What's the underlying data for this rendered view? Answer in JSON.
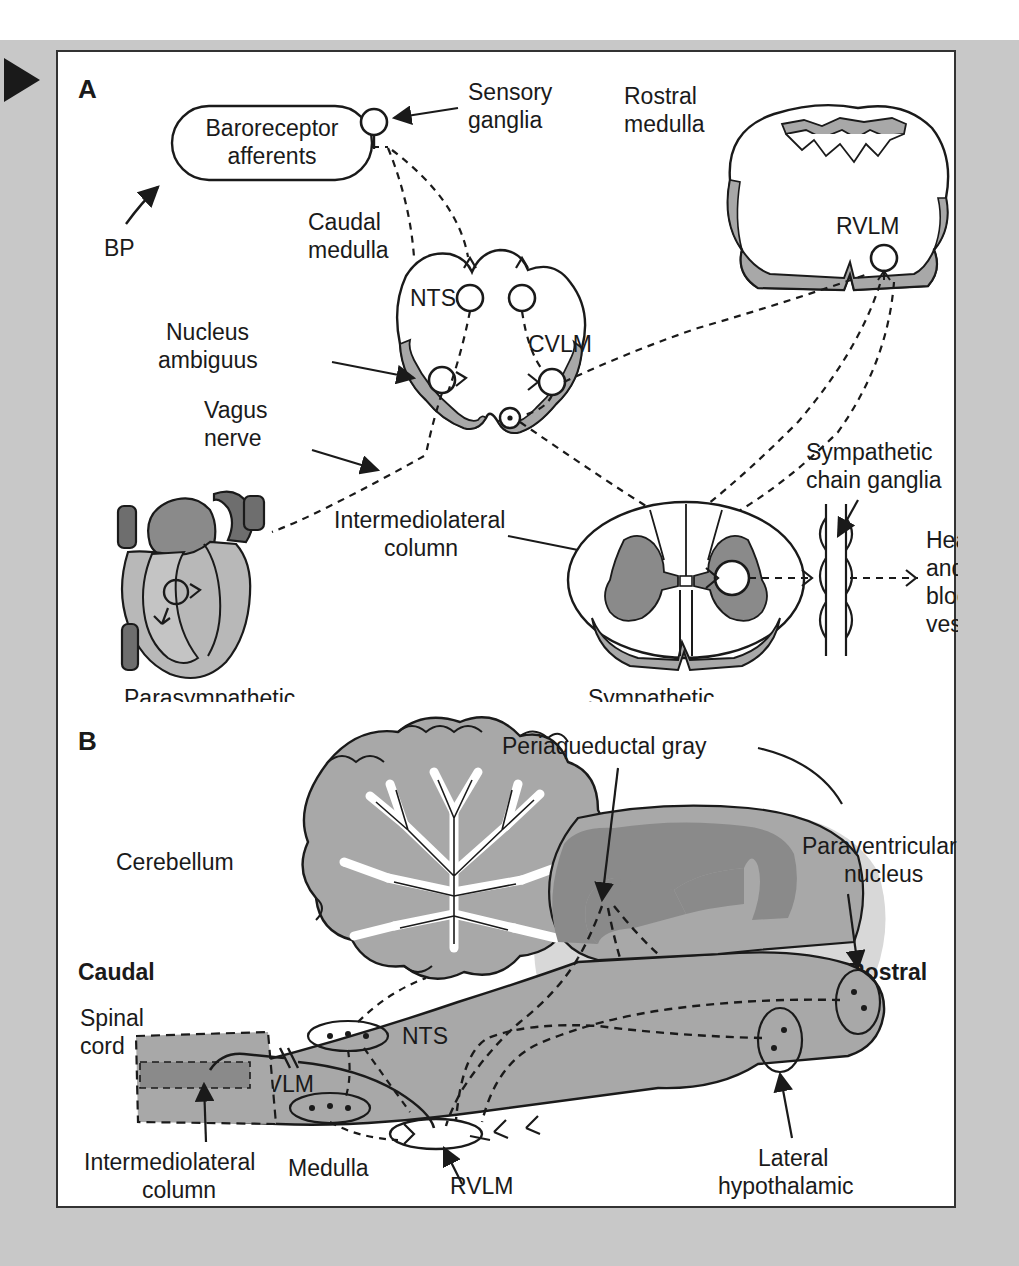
{
  "figure": {
    "type": "anatomical-diagram",
    "marker": "triangle-pointer"
  },
  "panel_a": {
    "letter": "A",
    "labels": {
      "baroreceptor_afferents": "Baroreceptor\nafferents",
      "baroreceptor_line1": "Baroreceptor",
      "baroreceptor_line2": "afferents",
      "bp": "BP",
      "sensory_ganglia_line1": "Sensory",
      "sensory_ganglia_line2": "ganglia",
      "rostral_medulla_line1": "Rostral",
      "rostral_medulla_line2": "medulla",
      "caudal_medulla_line1": "Caudal",
      "caudal_medulla_line2": "medulla",
      "nts": "NTS",
      "cvlm": "CVLM",
      "rvlm": "RVLM",
      "nucleus_ambiguus_line1": "Nucleus",
      "nucleus_ambiguus_line2": "ambiguus",
      "vagus_nerve_line1": "Vagus",
      "vagus_nerve_line2": "nerve",
      "intermediolateral_line1": "Intermediolateral",
      "intermediolateral_line2": "column",
      "sympathetic_chain_line1": "Sympathetic",
      "sympathetic_chain_line2": "chain ganglia",
      "heart_blood_line1": "Heart",
      "heart_blood_line2": "and",
      "heart_blood_line3": "blood",
      "heart_blood_line4": "vessels",
      "parasympathetic": "Parasympathetic",
      "sympathetic": "Sympathetic"
    }
  },
  "panel_b": {
    "letter": "B",
    "labels": {
      "cerebellum": "Cerebellum",
      "caudal": "Caudal",
      "rostral": "Rostral",
      "spinal_cord_line1": "Spinal",
      "spinal_cord_line2": "cord",
      "periaqueductal_gray": "Periaqueductal gray",
      "paraventricular_line1": "Paraventricular",
      "paraventricular_line2": "nucleus",
      "lateral_hypothalamic_line1": "Lateral",
      "lateral_hypothalamic_line2": "hypothalamic",
      "lateral_hypothalamic_line3": "area",
      "nts": "NTS",
      "cvlm": "CVLM",
      "rvlm": "RVLM",
      "medulla": "Medulla",
      "intermediolateral_line1": "Intermediolateral",
      "intermediolateral_line2": "column"
    }
  },
  "colors": {
    "page_background": "#c8c8c8",
    "panel_background": "#ffffff",
    "panel_border": "#333333",
    "stroke": "#1a1a1a",
    "tissue_gray": "#a8a8a8",
    "dark_gray": "#8a8a8a",
    "light_gray": "#c4c4c4",
    "heart_light": "#b8b8b8",
    "heart_dark": "#6e6e6e",
    "shadow_gray": "#d0d0d0"
  }
}
